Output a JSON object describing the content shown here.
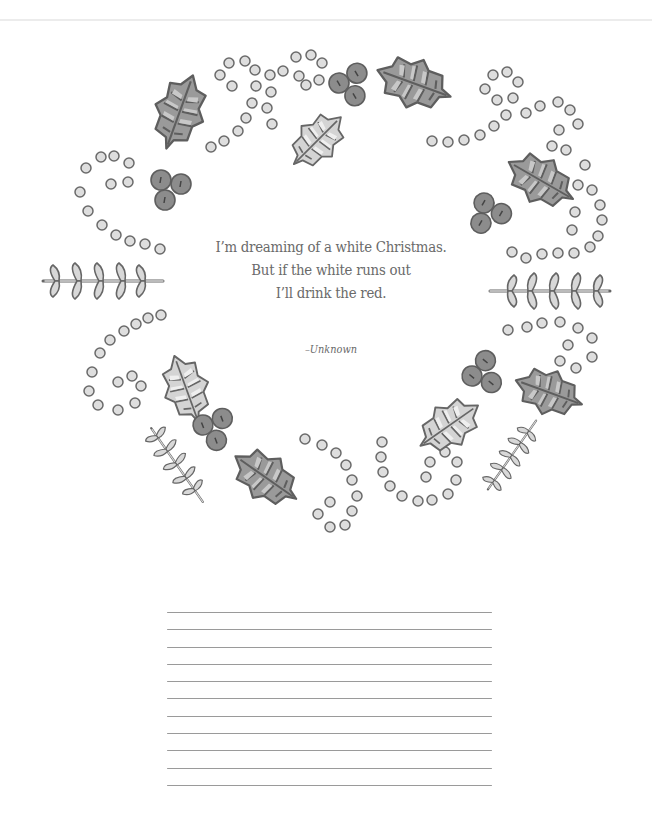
{
  "page": {
    "type": "coloring-page-journal"
  },
  "quote": {
    "lines": [
      "I’m dreaming of a white Christmas.",
      "But if the white runs out",
      "I’ll drink the red."
    ],
    "attribution": "–Unknown"
  },
  "decorations": {
    "wreath_elements": [
      "holly-leaf-icon",
      "holly-berry-icon",
      "dot-swirl-icon",
      "fern-sprig-icon"
    ]
  },
  "writing_area": {
    "line_count": 11
  },
  "colors": {
    "text": "#6a6a6a",
    "leaf_dark": "#8a8a8a",
    "leaf_light": "#cfcfcf",
    "berry": "#8c8c8c",
    "dot_fill": "#dcdcdc",
    "outline": "#5e5e5e",
    "rule_line": "#9a9a9a"
  }
}
